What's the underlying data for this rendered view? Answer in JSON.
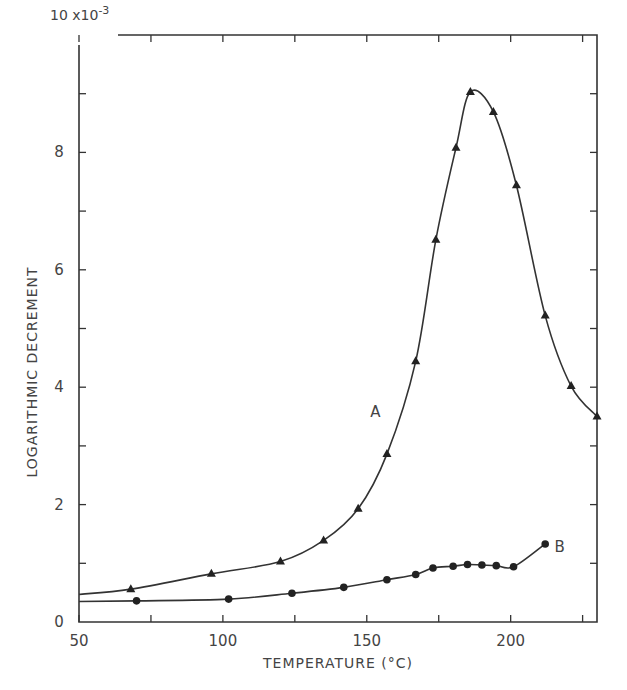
{
  "chart_data": {
    "type": "line",
    "title": "",
    "xlabel": "TEMPERATURE (°C)",
    "ylabel": "LOGARITHMIC DECREMENT",
    "y_scale_label": "10 x10",
    "y_scale_exp": "-3",
    "xlim": [
      50,
      230
    ],
    "ylim": [
      0,
      10
    ],
    "x_ticks": [
      50,
      100,
      150,
      200
    ],
    "y_ticks": [
      0,
      2,
      4,
      6,
      8
    ],
    "grid": false,
    "legend": "inline labels",
    "series": [
      {
        "name": "A",
        "marker": "triangle",
        "x": [
          68,
          96,
          120,
          135,
          147,
          157,
          167,
          174,
          181,
          186,
          194,
          202,
          212,
          221,
          230
        ],
        "y": [
          0.56,
          0.82,
          1.03,
          1.39,
          1.93,
          2.86,
          4.44,
          6.51,
          8.08,
          9.03,
          8.69,
          7.44,
          5.22,
          4.02,
          3.5
        ]
      },
      {
        "name": "B",
        "marker": "circle",
        "x": [
          70,
          102,
          124,
          142,
          157,
          167,
          173,
          180,
          185,
          190,
          195,
          201,
          212
        ],
        "y": [
          0.36,
          0.39,
          0.49,
          0.59,
          0.72,
          0.81,
          0.92,
          0.95,
          0.98,
          0.97,
          0.96,
          0.94,
          1.33
        ]
      }
    ],
    "annotations": [
      {
        "text": "A",
        "x": 153,
        "y": 3.6
      },
      {
        "text": "B",
        "x": 217,
        "y": 1.3
      }
    ]
  }
}
